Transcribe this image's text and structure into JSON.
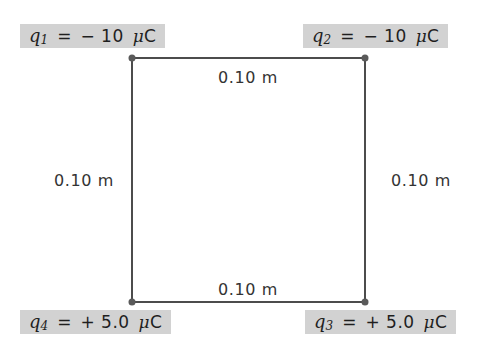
{
  "figure": {
    "background_color": "#ffffff",
    "line_color": "#4c4c4c",
    "label_background_color": "#d2d2d2",
    "label_text_color": "#1f1f1f"
  },
  "square": {
    "side_labels": {
      "top": "0.10 m",
      "right": "0.10 m",
      "bottom": "0.10 m",
      "left": "0.10 m"
    }
  },
  "charges": {
    "q1": {
      "symbol": "q",
      "subscript": "1",
      "equals": "=",
      "value": "− 10",
      "unit": "μC",
      "mu": "μ",
      "unit_letter": "C",
      "full_text": "q1 = − 10 μC",
      "position": "top-left"
    },
    "q2": {
      "symbol": "q",
      "subscript": "2",
      "equals": "=",
      "value": "− 10",
      "unit": "μC",
      "mu": "μ",
      "unit_letter": "C",
      "full_text": "q2 = − 10 μC",
      "position": "top-right"
    },
    "q3": {
      "symbol": "q",
      "subscript": "3",
      "equals": "=",
      "value": "+ 5.0",
      "unit": "μC",
      "mu": "μ",
      "unit_letter": "C",
      "full_text": "q3 = + 5.0 μC",
      "position": "bottom-right"
    },
    "q4": {
      "symbol": "q",
      "subscript": "4",
      "equals": "=",
      "value": "+ 5.0",
      "unit": "μC",
      "mu": "μ",
      "unit_letter": "C",
      "full_text": "q4 = + 5.0 μC",
      "position": "bottom-left"
    }
  }
}
